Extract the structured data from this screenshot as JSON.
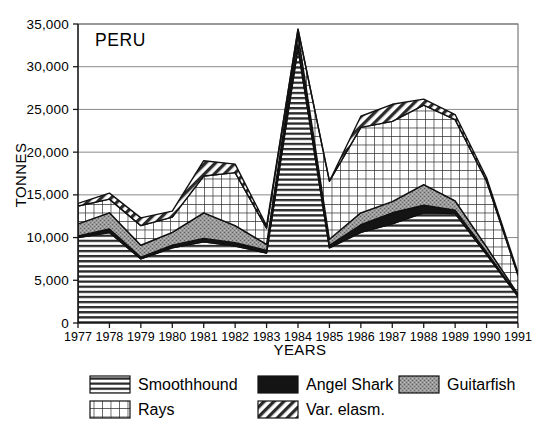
{
  "chart_data": {
    "type": "area",
    "title": "PERU",
    "xlabel": "YEARS",
    "ylabel": "TONNES",
    "stacked": true,
    "grid": true,
    "legend_position": "bottom",
    "x": [
      1977,
      1978,
      1979,
      1980,
      1981,
      1982,
      1983,
      1984,
      1985,
      1986,
      1987,
      1988,
      1989,
      1990,
      1991
    ],
    "categories": [
      "1977",
      "1978",
      "1979",
      "1980",
      "1981",
      "1982",
      "1983",
      "1984",
      "1985",
      "1986",
      "1987",
      "1988",
      "1989",
      "1990",
      "1991"
    ],
    "xlim": [
      1977,
      1991
    ],
    "ylim": [
      0,
      35000
    ],
    "yticks": [
      0,
      5000,
      10000,
      15000,
      20000,
      25000,
      30000,
      35000
    ],
    "ytick_labels": [
      "0",
      "5,000",
      "10,000",
      "15,000",
      "20,000",
      "25,000",
      "30,000",
      "35,000"
    ],
    "series": [
      {
        "name": "Smoothhound",
        "pattern": "horizontal-lines",
        "values": [
          10000,
          10600,
          7500,
          8800,
          9500,
          9000,
          8200,
          32200,
          8800,
          10600,
          11600,
          12900,
          12800,
          8000,
          3100
        ]
      },
      {
        "name": "Angel Shark",
        "pattern": "solid-black",
        "values": [
          200,
          400,
          200,
          300,
          400,
          400,
          300,
          400,
          300,
          900,
          1300,
          900,
          400,
          300,
          100
        ]
      },
      {
        "name": "Guitarfish",
        "pattern": "gray-stipple",
        "values": [
          1400,
          1900,
          1400,
          1500,
          3000,
          2000,
          700,
          1200,
          700,
          1400,
          1300,
          2400,
          1100,
          600,
          200
        ]
      },
      {
        "name": "Rays",
        "pattern": "cross-hatch",
        "values": [
          2100,
          1600,
          2300,
          1800,
          4300,
          6200,
          1900,
          600,
          6800,
          10000,
          9400,
          9300,
          9500,
          7700,
          2200
        ]
      },
      {
        "name": "Var. elasm.",
        "pattern": "diagonal-hatch",
        "values": [
          300,
          700,
          900,
          700,
          1800,
          1000,
          300,
          0,
          0,
          1300,
          2000,
          700,
          600,
          400,
          300
        ]
      }
    ],
    "totals": [
      14000,
      15200,
      12300,
      13100,
      19000,
      18600,
      11400,
      34400,
      16600,
      24200,
      25600,
      26200,
      24400,
      17000,
      5900
    ]
  },
  "legend": {
    "entries": [
      {
        "label": "Smoothhound",
        "pattern": "horizontal-lines"
      },
      {
        "label": "Angel Shark",
        "pattern": "solid-black"
      },
      {
        "label": "Guitarfish",
        "pattern": "gray-stipple"
      },
      {
        "label": "Rays",
        "pattern": "cross-hatch"
      },
      {
        "label": "Var. elasm.",
        "pattern": "diagonal-hatch"
      }
    ]
  },
  "colors": {
    "ink": "#111111",
    "grid": "#8a8a8a",
    "frame": "#6e6e6e",
    "gray_fill": "#8d8d8d",
    "black_fill": "#141414",
    "paper": "#ffffff"
  }
}
